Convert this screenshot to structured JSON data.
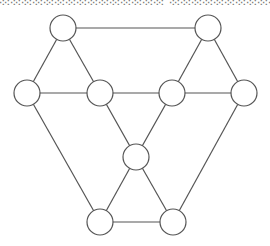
{
  "header": {
    "cut_text": "░░░░░░░░░░░░░░░ ░░░░░░░░░░░░░░"
  },
  "diagram": {
    "type": "graph",
    "stroke_color": "#555555",
    "node_fill": "#ffffff",
    "node_radius": 13,
    "nodes": [
      {
        "id": "top-left",
        "x": 63,
        "y": 28
      },
      {
        "id": "top-right",
        "x": 208,
        "y": 28
      },
      {
        "id": "left",
        "x": 27,
        "y": 93
      },
      {
        "id": "inner-left",
        "x": 100,
        "y": 93
      },
      {
        "id": "inner-right",
        "x": 172,
        "y": 93
      },
      {
        "id": "right",
        "x": 244,
        "y": 93
      },
      {
        "id": "center",
        "x": 136,
        "y": 157
      },
      {
        "id": "bottom-left",
        "x": 100,
        "y": 222
      },
      {
        "id": "bottom-right",
        "x": 173,
        "y": 222
      }
    ],
    "edges": [
      [
        "top-left",
        "top-right"
      ],
      [
        "top-left",
        "left"
      ],
      [
        "top-left",
        "inner-left"
      ],
      [
        "top-right",
        "inner-right"
      ],
      [
        "top-right",
        "right"
      ],
      [
        "left",
        "inner-left"
      ],
      [
        "inner-left",
        "inner-right"
      ],
      [
        "inner-right",
        "right"
      ],
      [
        "left",
        "bottom-left"
      ],
      [
        "right",
        "bottom-right"
      ],
      [
        "inner-left",
        "center"
      ],
      [
        "inner-right",
        "center"
      ],
      [
        "center",
        "bottom-left"
      ],
      [
        "center",
        "bottom-right"
      ],
      [
        "bottom-left",
        "bottom-right"
      ]
    ]
  }
}
